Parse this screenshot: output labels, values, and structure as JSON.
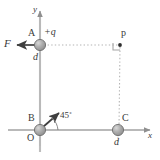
{
  "figure": {
    "axes": {
      "x_label": "x",
      "y_label": "y",
      "x_axis_name": "x-axis",
      "y_axis_name": "y-axis",
      "origin_label": "O"
    },
    "points": [
      {
        "id": "A",
        "label": "A",
        "charge_label": "+q",
        "distance_label": "d",
        "cx": 40,
        "cy": 45,
        "r": 5.5
      },
      {
        "id": "B",
        "label": "B",
        "cx": 40,
        "cy": 130,
        "r": 5.5
      },
      {
        "id": "C",
        "label": "C",
        "distance_label": "d",
        "cx": 118,
        "cy": 130,
        "r": 5.5
      },
      {
        "id": "p",
        "label": "p",
        "cx": 120,
        "cy": 45,
        "r": 1.8
      }
    ],
    "vectors": [
      {
        "name": "force-vector-F",
        "label": "F",
        "direction": "left",
        "from_x": 35,
        "from_y": 45,
        "to_x": 14,
        "to_y": 45
      },
      {
        "name": "velocity-vector-B",
        "label": "",
        "angle_label": "45˚",
        "from_x": 43,
        "from_y": 127,
        "to_x": 60,
        "to_y": 112
      }
    ],
    "annotations": {
      "angle_45": "45˚",
      "right_angle_marker": "right-angle-at-p"
    },
    "colors": {
      "sphere_fill": "#a8a8a8",
      "sphere_stroke": "#707070",
      "axis": "#b8b8b8",
      "dotted": "#b0b0b0",
      "text": "#3a3a3a",
      "arrow": "#3f3f3f",
      "background": "#ffffff"
    }
  }
}
